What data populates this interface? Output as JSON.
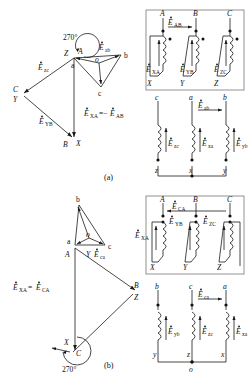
{
  "figure": {
    "title_a": "(a)",
    "title_b": "(b)"
  },
  "panel_a": {
    "phasor": {
      "angle_label": "270°",
      "inner_nodes": [
        "a",
        "b",
        "c",
        "o"
      ],
      "outer_nodes": [
        "A",
        "B",
        "C"
      ],
      "outer_nodes_alt": [
        "X",
        "Y",
        "Z"
      ],
      "vector_labels": {
        "ab": "Ė̇ab",
        "zc": "Ė̇zc",
        "yb": "Ė̇YB",
        "xa_eq": "Ė̇XA = −Ė̇AB"
      },
      "label_Eab_main": "E",
      "label_Eab_sub": "ab",
      "label_Ezc_main": "E",
      "label_Ezc_sub": "zc",
      "label_Eyb_main": "E",
      "label_Eyb_sub": "YB",
      "label_Exa_main": "E",
      "label_Exa_sub": "XA",
      "label_eq": "=−",
      "label_Eab2_main": "E",
      "label_Eab2_sub": "AB"
    },
    "circuit_top": {
      "terminals_top": [
        "A",
        "B",
        "C"
      ],
      "terminals_bottom": [
        "X",
        "Y",
        "Z"
      ],
      "emf_label_top_main": "E",
      "emf_label_top_sub": "AB",
      "coil_emfs": [
        {
          "main": "E",
          "sub": "XA"
        },
        {
          "main": "E",
          "sub": "YB"
        },
        {
          "main": "E",
          "sub": "ZC"
        }
      ]
    },
    "circuit_bottom": {
      "terminals_top": [
        "c",
        "a",
        "b"
      ],
      "terminals_bottom": [
        "z",
        "x",
        "y"
      ],
      "emf_label_top_main": "E",
      "emf_label_top_sub": "ab",
      "coil_emfs": [
        {
          "main": "E",
          "sub": "zc"
        },
        {
          "main": "E",
          "sub": "xa"
        },
        {
          "main": "E",
          "sub": "yb"
        }
      ]
    }
  },
  "panel_b": {
    "phasor": {
      "angle_label": "270°",
      "inner_nodes": [
        "a",
        "b",
        "c",
        "o"
      ],
      "outer_nodes": [
        "A",
        "B",
        "C"
      ],
      "outer_nodes_alt": [
        "X",
        "Y",
        "Z"
      ],
      "label_Eca_main": "E",
      "label_Eca_sub": "ca",
      "label_Exa_main": "E",
      "label_Exa_sub": "XA",
      "label_eq": "=",
      "label_Eca2_main": "E",
      "label_Eca2_sub": "CA"
    },
    "circuit_top": {
      "terminals_top": [
        "A",
        "B",
        "C"
      ],
      "terminals_bottom": [
        "X",
        "Y",
        "Z"
      ],
      "emf_label_top_main": "E",
      "emf_label_top_sub": "CA",
      "emf_left_main": "E",
      "emf_left_sub": "XA",
      "coil_emfs": [
        {
          "main": "E",
          "sub": "YB"
        },
        {
          "main": "E",
          "sub": "ZC"
        }
      ]
    },
    "circuit_bottom": {
      "terminals_top": [
        "b",
        "c",
        "a"
      ],
      "terminals_bottom": [
        "y",
        "z",
        "x"
      ],
      "neutral_label": "o",
      "emf_label_top_main": "E",
      "emf_label_top_sub": "ca",
      "coil_emfs": [
        {
          "main": "E",
          "sub": "yb"
        },
        {
          "main": "E",
          "sub": "zc"
        },
        {
          "main": "E",
          "sub": "xa"
        }
      ]
    }
  },
  "colors": {
    "ink": "#1a1a1a",
    "box": "#6e6e6e",
    "background": "#ffffff"
  }
}
